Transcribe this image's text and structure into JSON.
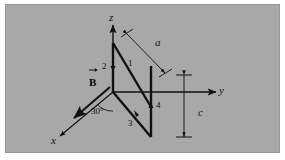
{
  "figure": {
    "kind": "physics-diagram",
    "background_color": "#a8a8a8",
    "ink_color": "#111111",
    "axes": [
      {
        "name": "z-axis",
        "label": "z",
        "direction": "up"
      },
      {
        "name": "y-axis",
        "label": "y",
        "direction": "right"
      },
      {
        "name": "x-axis",
        "label": "x",
        "direction": "down-left"
      }
    ],
    "field_vector": {
      "label": "B",
      "overline_accent": "arrow",
      "direction": "down-left"
    },
    "angle": {
      "label": "30°",
      "between": "x-axis and loop edge 3"
    },
    "dimensions": [
      {
        "name": "a",
        "label": "a",
        "orientation": "diagonal-upper-right"
      },
      {
        "name": "c",
        "label": "c",
        "orientation": "vertical-right"
      }
    ],
    "edge_labels": [
      {
        "id": "edge-1",
        "label": "1"
      },
      {
        "id": "edge-2",
        "label": "2"
      },
      {
        "id": "edge-3",
        "label": "3"
      },
      {
        "id": "edge-4",
        "label": "4"
      }
    ]
  }
}
